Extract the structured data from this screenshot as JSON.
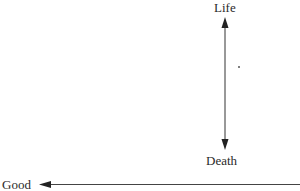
{
  "diagram": {
    "labels": {
      "top": "Life",
      "bottom": "Death",
      "left": "Good"
    },
    "marks": {
      "dot": "*"
    },
    "colors": {
      "line": "#333333",
      "text": "#2a2a2a"
    }
  }
}
